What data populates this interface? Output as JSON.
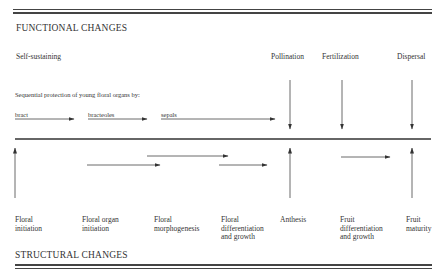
{
  "headings": {
    "functional": "FUNCTIONAL CHANGES",
    "structural": "STRUCTURAL CHANGES"
  },
  "functional": {
    "self_sustaining": "Self-sustaining",
    "events": [
      {
        "label": "Pollination"
      },
      {
        "label": "Fertilization"
      },
      {
        "label": "Dispersal"
      }
    ],
    "protection_caption": "Sequential protection of young floral organs by:",
    "protection_organs": [
      {
        "label": "bract"
      },
      {
        "label": "bracteoles"
      },
      {
        "label": "sepals"
      }
    ]
  },
  "structural": {
    "stages": [
      {
        "line1": "Floral",
        "line2": "initiation",
        "line3": ""
      },
      {
        "line1": "Floral organ",
        "line2": "initiation",
        "line3": ""
      },
      {
        "line1": "Floral",
        "line2": "morphogenesis",
        "line3": ""
      },
      {
        "line1": "Floral",
        "line2": "differentiation",
        "line3": "and growth"
      },
      {
        "line1": "Anthesis",
        "line2": "",
        "line3": ""
      },
      {
        "line1": "Fruit",
        "line2": "differentiation",
        "line3": "and growth"
      },
      {
        "line1": "Fruit",
        "line2": "maturity",
        "line3": ""
      }
    ]
  },
  "colors": {
    "ink": "#333333",
    "background": "#ffffff"
  }
}
